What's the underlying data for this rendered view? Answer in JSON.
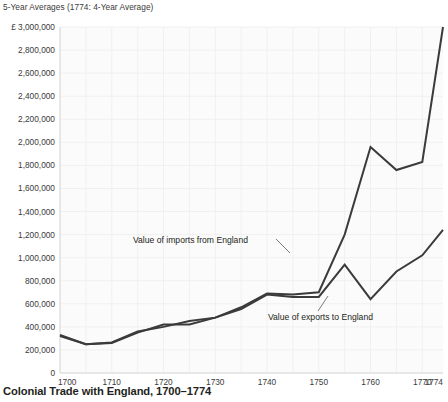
{
  "figure": {
    "note": "5-Year Averages (1774: 4-Year Average)",
    "title": "Colonial Trade with England, 1700–1774",
    "currency_prefix": "£"
  },
  "annotations": {
    "imports_label": "Value of imports from England",
    "exports_label": "Value of exports to England"
  },
  "chart_data": {
    "type": "line",
    "title": "Colonial Trade with England, 1700–1774",
    "subtitle": "5-Year Averages (1774: 4-Year Average)",
    "xlabel": "",
    "ylabel": "£",
    "xlim": [
      1700,
      1774
    ],
    "ylim": [
      0,
      3000000
    ],
    "grid": true,
    "legend_position": "inline-annotations",
    "y_ticks": [
      0,
      200000,
      400000,
      600000,
      800000,
      1000000,
      1200000,
      1400000,
      1600000,
      1800000,
      2000000,
      2200000,
      2400000,
      2600000,
      2800000,
      3000000
    ],
    "y_tick_labels": [
      "0",
      "200,000",
      "400,000",
      "600,000",
      "800,000",
      "1,000,000",
      "1,200,000",
      "1,400,000",
      "1,600,000",
      "1,800,000",
      "2,000,000",
      "2,200,000",
      "2,400,000",
      "2,600,000",
      "2,800,000",
      "£ 3,000,000"
    ],
    "x_ticks": [
      1700,
      1710,
      1720,
      1730,
      1740,
      1750,
      1760,
      1770,
      1774
    ],
    "x_tick_labels": [
      "1700",
      "1710",
      "1720",
      "1730",
      "1740",
      "1750",
      "1760",
      "1770",
      "1774"
    ],
    "x": [
      1700,
      1705,
      1710,
      1715,
      1720,
      1725,
      1730,
      1735,
      1740,
      1745,
      1750,
      1755,
      1760,
      1765,
      1770,
      1774
    ],
    "series": [
      {
        "name": "Value of imports from England",
        "values": [
          330000,
          250000,
          260000,
          350000,
          420000,
          420000,
          480000,
          570000,
          690000,
          680000,
          700000,
          1200000,
          1960000,
          1760000,
          1830000,
          3000000
        ]
      },
      {
        "name": "Value of exports to England",
        "values": [
          320000,
          250000,
          265000,
          360000,
          400000,
          450000,
          480000,
          555000,
          680000,
          660000,
          660000,
          940000,
          640000,
          880000,
          1020000,
          1240000
        ]
      }
    ]
  }
}
